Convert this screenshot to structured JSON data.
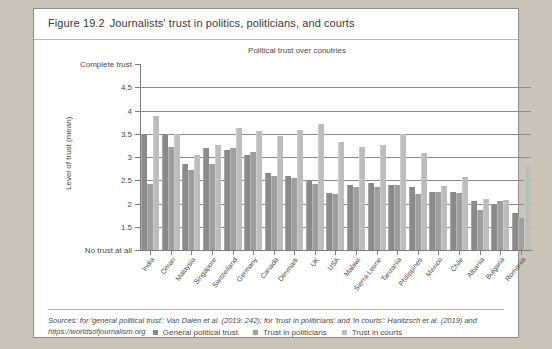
{
  "figure": {
    "number": "Figure 19.2",
    "caption": "Journalists' trust in politics, politicians, and courts"
  },
  "sources": {
    "text": "Sources: for 'general political trust': Van Dalen et al. (2019: 242); for 'trust in politicians' and 'in courts': Hanitzsch et al. (2019) and https://worldsofjournalism.org"
  },
  "legend": {
    "items": [
      {
        "label": "General political trust",
        "color": "#8a8a8a"
      },
      {
        "label": "Trust in politicians",
        "color": "#9e9e9e"
      },
      {
        "label": "Trust in courts",
        "color": "#bdbdbd"
      }
    ]
  },
  "chart_data": {
    "type": "bar",
    "title": "Political trust over conutries",
    "xlabel": "",
    "ylabel": "Level of trust (mean)",
    "ylim": [
      1,
      5
    ],
    "grid": true,
    "legend_position": "bottom",
    "y_axis_top_label": "Complete trust",
    "y_axis_bottom_label": "No trust at all",
    "ytick_values": [
      5,
      4.5,
      4,
      3.5,
      3,
      2.5,
      2,
      1.5,
      1
    ],
    "ytick_labels": [
      "Complete trust",
      "4.5",
      "4",
      "3.5",
      "3",
      "2.5",
      "2",
      "1.5",
      "No trust at all"
    ],
    "categories": [
      "India",
      "Oman",
      "Malaysia",
      "Singapore",
      "Switzerland",
      "Germany",
      "Canada",
      "Denmark",
      "UK",
      "USA",
      "Malawi",
      "Sierra Leone",
      "Tanzania",
      "Philippines",
      "Mexico",
      "Chile",
      "Albania",
      "Bulgaria",
      "Romania"
    ],
    "series": [
      {
        "name": "General political trust",
        "color": "#8a8a8a",
        "values": [
          3.5,
          3.5,
          2.85,
          3.2,
          3.15,
          3.05,
          2.65,
          2.6,
          2.5,
          2.22,
          2.4,
          2.45,
          2.4,
          2.35,
          2.25,
          2.25,
          2.05,
          2.0,
          1.8
        ]
      },
      {
        "name": "Trust in politicians",
        "color": "#9e9e9e",
        "values": [
          2.42,
          3.22,
          2.72,
          2.85,
          3.2,
          3.1,
          2.6,
          2.55,
          2.42,
          2.2,
          2.35,
          2.35,
          2.4,
          2.2,
          2.25,
          2.22,
          1.85,
          2.05,
          1.68
        ]
      },
      {
        "name": "Trust in courts",
        "color": "#bdbdbd",
        "values": [
          3.88,
          3.5,
          3.05,
          3.25,
          3.62,
          3.55,
          3.45,
          3.58,
          3.72,
          3.32,
          3.22,
          3.25,
          3.5,
          3.08,
          2.38,
          2.58,
          2.1,
          2.08,
          2.8
        ]
      }
    ]
  }
}
